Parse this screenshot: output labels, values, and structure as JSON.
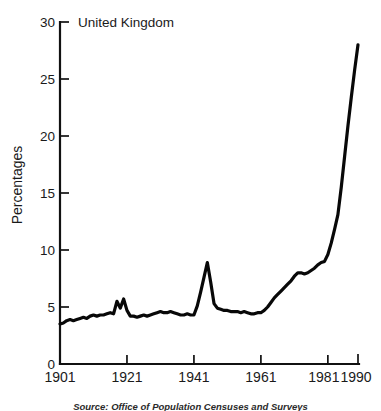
{
  "chart_data": {
    "type": "line",
    "title": "United Kingdom",
    "xlabel": "",
    "ylabel": "Percentages",
    "xlim": [
      1901,
      1990
    ],
    "ylim": [
      0,
      30
    ],
    "grid": false,
    "legend": null,
    "xticks": [
      "1901",
      "1921",
      "1941",
      "1961",
      "1981",
      "1990"
    ],
    "xtick_values": [
      1901,
      1921,
      1941,
      1961,
      1981,
      1990
    ],
    "yticks": [
      "0",
      "5",
      "10",
      "15",
      "20",
      "25",
      "30"
    ],
    "ytick_values": [
      0,
      5,
      10,
      15,
      20,
      25,
      30
    ],
    "series": [
      {
        "name": "United Kingdom",
        "color": "#080808",
        "x": [
          1901,
          1902,
          1903,
          1904,
          1905,
          1906,
          1907,
          1908,
          1909,
          1910,
          1911,
          1912,
          1913,
          1914,
          1915,
          1916,
          1917,
          1918,
          1919,
          1920,
          1921,
          1922,
          1923,
          1924,
          1925,
          1926,
          1927,
          1928,
          1929,
          1930,
          1931,
          1932,
          1933,
          1934,
          1935,
          1936,
          1937,
          1938,
          1939,
          1940,
          1941,
          1942,
          1943,
          1944,
          1945,
          1946,
          1947,
          1948,
          1949,
          1950,
          1951,
          1952,
          1953,
          1954,
          1955,
          1956,
          1957,
          1958,
          1959,
          1960,
          1961,
          1962,
          1963,
          1964,
          1965,
          1966,
          1967,
          1968,
          1969,
          1970,
          1971,
          1972,
          1973,
          1974,
          1975,
          1976,
          1977,
          1978,
          1979,
          1980,
          1981,
          1982,
          1983,
          1984,
          1985,
          1986,
          1987,
          1988,
          1989,
          1990
        ],
        "y": [
          3.5,
          3.6,
          3.8,
          3.9,
          3.8,
          3.9,
          4.0,
          4.1,
          4.0,
          4.2,
          4.3,
          4.2,
          4.3,
          4.3,
          4.4,
          4.5,
          4.4,
          5.5,
          4.9,
          5.7,
          4.7,
          4.2,
          4.2,
          4.1,
          4.2,
          4.3,
          4.2,
          4.3,
          4.4,
          4.5,
          4.6,
          4.5,
          4.5,
          4.6,
          4.5,
          4.4,
          4.3,
          4.3,
          4.4,
          4.3,
          4.3,
          5.1,
          6.3,
          7.6,
          8.9,
          7.2,
          5.3,
          4.9,
          4.8,
          4.7,
          4.7,
          4.6,
          4.6,
          4.6,
          4.5,
          4.6,
          4.5,
          4.4,
          4.4,
          4.5,
          4.5,
          4.7,
          5.0,
          5.4,
          5.8,
          6.1,
          6.4,
          6.7,
          7.0,
          7.3,
          7.7,
          8.0,
          8.0,
          7.9,
          8.0,
          8.2,
          8.4,
          8.7,
          8.9,
          9.0,
          9.6,
          10.6,
          11.8,
          13.1,
          15.5,
          18.2,
          20.9,
          23.4,
          25.8,
          28.0
        ]
      }
    ],
    "source": "Source: Office of Population Censuses and Surveys"
  }
}
